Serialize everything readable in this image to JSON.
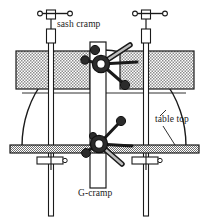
{
  "figure": {
    "background_color": "#ffffff",
    "ink_color": "#1a1a1a",
    "stipple_color": "#8c8c8c",
    "metal_fill": "#3a3a3a",
    "width": 209,
    "height": 223
  },
  "labels": {
    "sash_cramp": "sash cramp",
    "g_cramp": "G-cramp",
    "table_top": "table top"
  },
  "label_positions": {
    "sash_cramp": {
      "x": 57,
      "y": 27
    },
    "g_cramp": {
      "x": 78,
      "y": 196
    },
    "table_top": {
      "x": 155,
      "y": 120
    }
  },
  "components": {
    "sash_cramps": [
      {
        "name": "left-sash-cramp",
        "bar_x": 51,
        "bar_top": 14,
        "bar_bottom": 216,
        "handle_y": 14,
        "screw_box_y": 32,
        "stop_y": 157
      },
      {
        "name": "right-sash-cramp",
        "bar_x": 146,
        "bar_top": 14,
        "bar_bottom": 216,
        "handle_y": 14,
        "screw_box_y": 32,
        "stop_y": 157
      }
    ],
    "g_cramps": [
      {
        "name": "upper-g-cramp",
        "hub_x": 101,
        "hub_y": 64
      },
      {
        "name": "lower-g-cramp",
        "hub_x": 99,
        "hub_y": 144
      }
    ],
    "workpiece": {
      "name": "curved-workpiece",
      "arc_left_x": 22,
      "arc_right_x": 186,
      "arc_base_y": 146,
      "arc_top_y": 50,
      "seam_y": 93,
      "splice_strip": {
        "x": 90,
        "width": 16,
        "top": 42,
        "bottom": 188
      }
    },
    "blocks": [
      {
        "name": "left-packing-block",
        "x": 16,
        "y": 51,
        "width": 74,
        "height": 38
      },
      {
        "name": "right-packing-block",
        "x": 120,
        "y": 51,
        "width": 74,
        "height": 38
      }
    ],
    "table_top_bar": {
      "name": "table-top-bar",
      "x": 10,
      "y": 145,
      "width": 189,
      "height": 8
    }
  }
}
